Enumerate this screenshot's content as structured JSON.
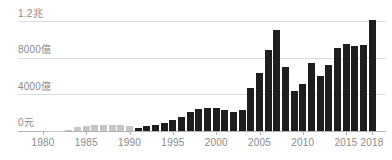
{
  "chart_data": {
    "type": "bar",
    "title": "",
    "unit": "億元",
    "x": [
      1980,
      1981,
      1982,
      1983,
      1984,
      1985,
      1986,
      1987,
      1988,
      1989,
      1990,
      1991,
      1992,
      1993,
      1994,
      1995,
      1996,
      1997,
      1998,
      1999,
      2000,
      2001,
      2002,
      2003,
      2004,
      2005,
      2006,
      2007,
      2008,
      2009,
      2010,
      2011,
      2012,
      2013,
      2014,
      2015,
      2016,
      2017,
      2018
    ],
    "values": [
      15,
      25,
      55,
      110,
      480,
      560,
      630,
      690,
      690,
      660,
      520,
      320,
      590,
      620,
      900,
      1200,
      1530,
      2040,
      2420,
      2480,
      2480,
      2290,
      2110,
      2290,
      4720,
      6400,
      8840,
      11050,
      7010,
      4360,
      5200,
      7420,
      6030,
      7280,
      9090,
      9570,
      9310,
      9380,
      12150
    ],
    "muted_through_year": 1990,
    "y_ticks": [
      {
        "label": "1.2兆",
        "value": 12000
      },
      {
        "label": "8000億",
        "value": 8000
      },
      {
        "label": "4000億",
        "value": 4000
      },
      {
        "label": "0元",
        "value": 0
      }
    ],
    "x_tick_labels": [
      "1980",
      "1985",
      "1990",
      "1995",
      "2000",
      "2005",
      "2010",
      "2015",
      "2018"
    ],
    "ylim": [
      0,
      12000
    ],
    "grid": true,
    "legend": null,
    "colors": {
      "bar": "#1e1e1e",
      "muted_bar": "#c6c6c6",
      "grid": "#dcdcdc",
      "axis": "#b4b4b4",
      "label": "#8a8a8a"
    }
  }
}
